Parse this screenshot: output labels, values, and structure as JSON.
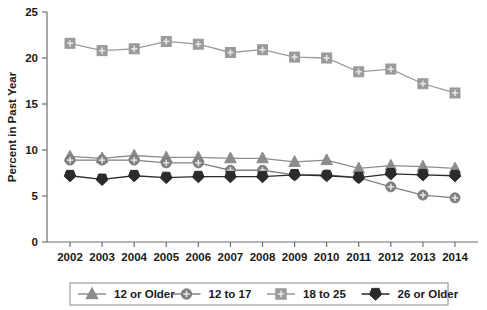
{
  "chart_data": {
    "type": "line",
    "title": "",
    "xlabel": "",
    "ylabel": "Percent in Past Year",
    "categories": [
      "2002",
      "2003",
      "2004",
      "2005",
      "2006",
      "2007",
      "2008",
      "2009",
      "2010",
      "2011",
      "2012",
      "2013",
      "2014"
    ],
    "x": [
      2002,
      2003,
      2004,
      2005,
      2006,
      2007,
      2008,
      2009,
      2010,
      2011,
      2012,
      2013,
      2014
    ],
    "ylim": [
      0,
      25
    ],
    "yticks": [
      0,
      5,
      10,
      15,
      20,
      25
    ],
    "grid": false,
    "legend_position": "bottom",
    "series": [
      {
        "name": "12 or Older",
        "marker": "triangle",
        "color": "#8c8c8c",
        "values": [
          9.3,
          9.1,
          9.4,
          9.2,
          9.2,
          9.1,
          9.1,
          8.7,
          8.9,
          8.0,
          8.3,
          8.2,
          8.0
        ]
      },
      {
        "name": "12 to 17",
        "marker": "circle",
        "color": "#808080",
        "values": [
          8.9,
          8.9,
          8.9,
          8.6,
          8.6,
          7.8,
          7.8,
          7.3,
          7.3,
          7.0,
          6.0,
          5.1,
          4.8
        ]
      },
      {
        "name": "18 to 25",
        "marker": "square",
        "color": "#9a9a9a",
        "values": [
          21.6,
          20.8,
          21.0,
          21.8,
          21.5,
          20.6,
          20.9,
          20.1,
          20.0,
          18.5,
          18.8,
          17.2,
          16.2
        ]
      },
      {
        "name": "26 or Older",
        "marker": "diamond",
        "color": "#2b2b2b",
        "values": [
          7.2,
          6.8,
          7.2,
          7.0,
          7.1,
          7.1,
          7.1,
          7.3,
          7.2,
          7.0,
          7.4,
          7.3,
          7.2
        ]
      }
    ]
  },
  "axes": {
    "y_label": "Percent in Past Year",
    "y_tick_labels": [
      "0",
      "5",
      "10",
      "15",
      "20",
      "25"
    ],
    "x_tick_labels": [
      "2002",
      "2003",
      "2004",
      "2005",
      "2006",
      "2007",
      "2008",
      "2009",
      "2010",
      "2011",
      "2012",
      "2013",
      "2014"
    ]
  },
  "legend": {
    "entries": [
      {
        "label": "12 or Older",
        "marker": "triangle",
        "color": "#8c8c8c"
      },
      {
        "label": "12 to 17",
        "marker": "circle",
        "color": "#808080"
      },
      {
        "label": "18 to 25",
        "marker": "square",
        "color": "#9a9a9a"
      },
      {
        "label": "26 or Older",
        "marker": "diamond",
        "color": "#2b2b2b"
      }
    ]
  },
  "colors": {
    "background": "#ffffff",
    "axis": "#6e6e6e",
    "text": "#1a1a1a",
    "series_12_or_older": "#8c8c8c",
    "series_12_to_17": "#808080",
    "series_18_to_25": "#9a9a9a",
    "series_26_or_older": "#2b2b2b"
  }
}
